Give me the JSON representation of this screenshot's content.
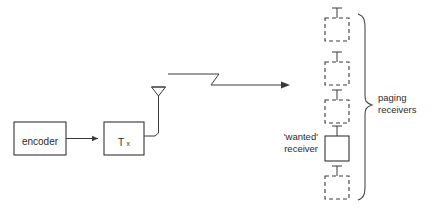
{
  "diagram": {
    "background_color": "#ffffff",
    "line_color": "#3a3a3a",
    "text_color": "#2b2b2b",
    "blocks": [
      {
        "id": "encoder",
        "label": "encoder",
        "style": "solid",
        "x": 14,
        "y": 122,
        "w": 52,
        "h": 33
      },
      {
        "id": "transmitter",
        "label": "T",
        "sublabel": "x",
        "style": "solid",
        "x": 104,
        "y": 122,
        "w": 40,
        "h": 33
      }
    ],
    "receivers": [
      {
        "id": "receiver-1",
        "style": "dashed",
        "wanted": false,
        "x": 325,
        "y": 18,
        "w": 24,
        "h": 23
      },
      {
        "id": "receiver-2",
        "style": "dashed",
        "wanted": false,
        "x": 325,
        "y": 62,
        "w": 24,
        "h": 23
      },
      {
        "id": "receiver-3",
        "style": "dashed",
        "wanted": false,
        "x": 325,
        "y": 100,
        "w": 24,
        "h": 23
      },
      {
        "id": "receiver-4",
        "style": "solid",
        "wanted": true,
        "x": 325,
        "y": 136,
        "w": 24,
        "h": 25
      },
      {
        "id": "receiver-5",
        "style": "dashed",
        "wanted": false,
        "x": 325,
        "y": 176,
        "w": 24,
        "h": 23
      }
    ],
    "annotations": {
      "wanted_receiver": {
        "line1": "'wanted'",
        "line2": "receiver"
      },
      "paging_receivers": {
        "line1": "paging",
        "line2": "receivers"
      }
    },
    "icons": {
      "transmit_antenna": "antenna-icon",
      "receive_antenna": "antenna-stub-icon",
      "signal": "radio-signal-arrow-icon",
      "grouping": "curly-brace-icon",
      "data_flow": "arrow-right-icon"
    }
  }
}
